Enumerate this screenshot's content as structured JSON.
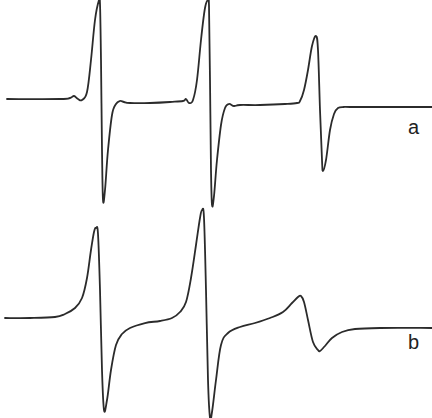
{
  "chart_data": {
    "type": "line",
    "title": "",
    "xlabel": "",
    "ylabel": "",
    "grid": false,
    "legend": null,
    "series": [
      {
        "name": "a",
        "label_position": {
          "x": 408,
          "y": 117
        },
        "baseline_y": 100,
        "lines": [
          {
            "center_x": 101,
            "peak": {
              "x": 99,
              "y": 0
            },
            "trough": {
              "x": 103,
              "y": 200
            }
          },
          {
            "center_x": 210,
            "peak": {
              "x": 208,
              "y": 0
            },
            "trough": {
              "x": 212,
              "y": 205
            }
          },
          {
            "center_x": 319,
            "peak": {
              "x": 316,
              "y": 36
            },
            "trough": {
              "x": 323,
              "y": 171
            }
          }
        ],
        "points": [
          [
            7,
            99
          ],
          [
            60,
            99
          ],
          [
            70,
            98
          ],
          [
            74,
            96
          ],
          [
            78,
            99
          ],
          [
            82,
            100
          ],
          [
            87,
            92
          ],
          [
            91,
            60
          ],
          [
            95,
            20
          ],
          [
            99,
            0
          ],
          [
            100,
            4
          ],
          [
            101,
            60
          ],
          [
            102,
            150
          ],
          [
            103,
            200
          ],
          [
            105,
            190
          ],
          [
            108,
            150
          ],
          [
            112,
            115
          ],
          [
            116,
            104
          ],
          [
            120,
            101
          ],
          [
            124,
            102
          ],
          [
            130,
            103
          ],
          [
            150,
            103
          ],
          [
            170,
            102
          ],
          [
            183,
            101
          ],
          [
            186,
            99
          ],
          [
            189,
            103
          ],
          [
            193,
            100
          ],
          [
            197,
            80
          ],
          [
            201,
            40
          ],
          [
            205,
            8
          ],
          [
            208,
            0
          ],
          [
            209,
            6
          ],
          [
            210,
            80
          ],
          [
            211,
            170
          ],
          [
            212,
            205
          ],
          [
            214,
            196
          ],
          [
            217,
            160
          ],
          [
            221,
            125
          ],
          [
            225,
            108
          ],
          [
            229,
            104
          ],
          [
            234,
            106
          ],
          [
            240,
            105
          ],
          [
            260,
            105
          ],
          [
            285,
            104
          ],
          [
            297,
            103
          ],
          [
            300,
            101
          ],
          [
            304,
            90
          ],
          [
            308,
            70
          ],
          [
            312,
            46
          ],
          [
            316,
            36
          ],
          [
            318,
            50
          ],
          [
            320,
            110
          ],
          [
            322,
            160
          ],
          [
            323,
            171
          ],
          [
            326,
            160
          ],
          [
            330,
            130
          ],
          [
            334,
            114
          ],
          [
            338,
            108
          ],
          [
            344,
            107
          ],
          [
            350,
            107
          ],
          [
            380,
            107
          ],
          [
            432,
            107
          ]
        ]
      },
      {
        "name": "b",
        "label_position": {
          "x": 408,
          "y": 332
        },
        "baseline_y": 318,
        "lines": [
          {
            "center_x": 100,
            "peak": {
              "x": 96,
              "y": 228
            },
            "trough": {
              "x": 104,
              "y": 410
            }
          },
          {
            "center_x": 206,
            "peak": {
              "x": 202,
              "y": 210
            },
            "trough": {
              "x": 210,
              "y": 418
            }
          },
          {
            "center_x": 310,
            "peak": {
              "x": 300,
              "y": 296
            },
            "trough": {
              "x": 320,
              "y": 351
            }
          }
        ],
        "points": [
          [
            5,
            318
          ],
          [
            30,
            318
          ],
          [
            55,
            317
          ],
          [
            65,
            314
          ],
          [
            75,
            308
          ],
          [
            82,
            298
          ],
          [
            87,
            278
          ],
          [
            91,
            250
          ],
          [
            94,
            232
          ],
          [
            96,
            228
          ],
          [
            98,
            234
          ],
          [
            100,
            290
          ],
          [
            102,
            370
          ],
          [
            104,
            410
          ],
          [
            107,
            400
          ],
          [
            111,
            370
          ],
          [
            116,
            345
          ],
          [
            122,
            334
          ],
          [
            130,
            328
          ],
          [
            145,
            323
          ],
          [
            160,
            321
          ],
          [
            172,
            318
          ],
          [
            180,
            312
          ],
          [
            186,
            302
          ],
          [
            191,
            278
          ],
          [
            196,
            245
          ],
          [
            200,
            218
          ],
          [
            202,
            210
          ],
          [
            204,
            218
          ],
          [
            206,
            290
          ],
          [
            208,
            380
          ],
          [
            210,
            418
          ],
          [
            212,
            412
          ],
          [
            216,
            380
          ],
          [
            221,
            345
          ],
          [
            228,
            333
          ],
          [
            240,
            327
          ],
          [
            255,
            323
          ],
          [
            270,
            318
          ],
          [
            283,
            312
          ],
          [
            292,
            303
          ],
          [
            298,
            297
          ],
          [
            301,
            296
          ],
          [
            304,
            302
          ],
          [
            308,
            320
          ],
          [
            313,
            342
          ],
          [
            318,
            350
          ],
          [
            320,
            351
          ],
          [
            325,
            346
          ],
          [
            332,
            338
          ],
          [
            342,
            332
          ],
          [
            355,
            329
          ],
          [
            380,
            328
          ],
          [
            432,
            328
          ]
        ]
      }
    ]
  },
  "labels": {
    "a": "a",
    "b": "b"
  }
}
